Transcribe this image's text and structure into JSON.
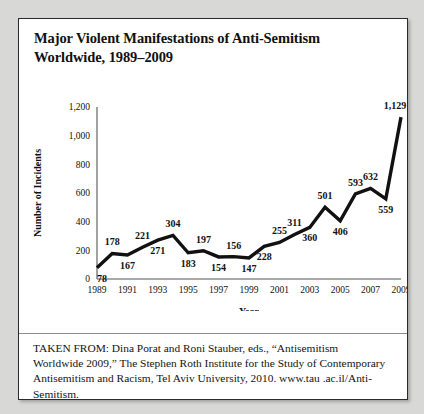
{
  "figure": {
    "title_line1": "Major Violent Manifestations of Anti-Semitism",
    "title_line2": "Worldwide, 1989–2009",
    "citation": "TAKEN FROM: Dina Porat and Roni Stauber, eds., “Antisemitism Worldwide 2009,” The Stephen Roth Institute for the Study of Contemporary Antisemitism and Racism, Tel Aviv University, 2010. www.tau .ac.il/Anti-Semitism."
  },
  "chart_data": {
    "type": "line",
    "title": "Major Violent Manifestations of Anti-Semitism Worldwide, 1989–2009",
    "xlabel": "Year",
    "ylabel": "Number of Incidents",
    "ylim": [
      0,
      1200
    ],
    "y_ticks": [
      0,
      200,
      400,
      600,
      800,
      1000,
      1200
    ],
    "y_tick_labels": [
      "0",
      "200",
      "400",
      "600",
      "800",
      "1,000",
      "1,200"
    ],
    "x_tick_labels": [
      "1989",
      "1991",
      "1993",
      "1995",
      "1997",
      "1999",
      "2001",
      "2003",
      "2005",
      "2007",
      "2009"
    ],
    "grid": false,
    "legend": false,
    "x": [
      1989,
      1990,
      1991,
      1992,
      1993,
      1994,
      1995,
      1996,
      1997,
      1998,
      1999,
      2000,
      2001,
      2002,
      2003,
      2004,
      2005,
      2006,
      2007,
      2008,
      2009
    ],
    "values": [
      78,
      178,
      167,
      221,
      271,
      304,
      183,
      197,
      154,
      156,
      147,
      228,
      255,
      311,
      360,
      501,
      406,
      593,
      632,
      559,
      1129
    ],
    "point_labels": [
      "78",
      "178",
      "167",
      "221",
      "271",
      "304",
      "183",
      "197",
      "154",
      "156",
      "147",
      "228",
      "255",
      "311",
      "360",
      "501",
      "406",
      "593",
      "632",
      "559",
      "1,129"
    ],
    "label_placement": [
      "below",
      "above",
      "below",
      "above",
      "below",
      "above",
      "below",
      "above",
      "below",
      "above",
      "below",
      "below",
      "above",
      "above",
      "below",
      "above",
      "below",
      "above",
      "above",
      "below",
      "above"
    ],
    "line_color": "#111111"
  }
}
